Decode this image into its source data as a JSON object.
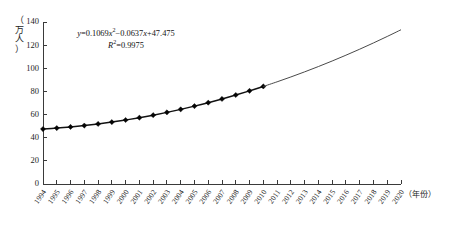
{
  "chart_data": {
    "type": "line",
    "title": "",
    "xlabel": "（年份）",
    "ylabel": "（万人）",
    "ylim": [
      0,
      140
    ],
    "ytick_values": [
      0,
      20,
      40,
      60,
      80,
      100,
      120,
      140
    ],
    "ytick_labels": [
      "0",
      "20",
      "40",
      "60",
      "80",
      "100",
      "120",
      "140"
    ],
    "xlim": [
      1994,
      2020
    ],
    "categories": [
      "1994",
      "1995",
      "1996",
      "1997",
      "1998",
      "1999",
      "2000",
      "2001",
      "2002",
      "2003",
      "2004",
      "2005",
      "2006",
      "2007",
      "2008",
      "2009",
      "2010",
      "2011",
      "2012",
      "2013",
      "2014",
      "2015",
      "2016",
      "2017",
      "2018",
      "2019",
      "2020"
    ],
    "grid": false,
    "legend": "none",
    "series": [
      {
        "name": "观测值",
        "marker": "diamond",
        "x": [
          1994,
          1995,
          1996,
          1997,
          1998,
          1999,
          2000,
          2001,
          2002,
          2003,
          2004,
          2005,
          2006,
          2007,
          2008,
          2009,
          2010
        ],
        "values": [
          47.5,
          48.3,
          49.3,
          50.5,
          51.9,
          53.5,
          55.3,
          57.3,
          59.5,
          61.9,
          64.5,
          67.3,
          70.3,
          73.5,
          76.9,
          80.5,
          84.3
        ]
      },
      {
        "name": "趋势外推",
        "marker": "none",
        "x": [
          2010,
          2011,
          2012,
          2013,
          2014,
          2015,
          2016,
          2017,
          2018,
          2019,
          2020
        ],
        "values": [
          84.3,
          88.3,
          92.5,
          96.9,
          101.5,
          106.3,
          111.3,
          116.5,
          121.9,
          127.5,
          133.3
        ]
      }
    ],
    "annotations": [
      {
        "name": "regression-equation",
        "text": "y=0.1069x²−0.0637x+47.475",
        "coefficients": {
          "a": 0.1069,
          "b": -0.0637,
          "c": 47.475
        }
      },
      {
        "name": "r-squared",
        "text": "R²=0.9975",
        "value": 0.9975
      }
    ]
  },
  "axes": {
    "y_unit": "（万人）",
    "y_unit_chars": [
      "（",
      "万",
      "人",
      "）"
    ],
    "x_unit": "（年份）"
  },
  "colors": {
    "axis": "#3a3a3a",
    "series_line": "#121212",
    "trend_line": "#4a4a4a",
    "marker": "#050505",
    "text": "#1c1c1c",
    "background": "#ffffff"
  }
}
